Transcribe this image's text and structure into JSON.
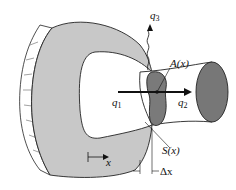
{
  "diagram": {
    "colors": {
      "body_fill": "#c8c8c8",
      "section_fill": "#7a7a7a",
      "end_fill": "#777777",
      "outline": "#222222",
      "background": "#ffffff"
    },
    "labels": {
      "q1": {
        "main": "q",
        "sub": "1"
      },
      "q2": {
        "main": "q",
        "sub": "2"
      },
      "q3": {
        "main": "q",
        "sub": "3"
      },
      "area": "A(x)",
      "surface": "S(x)",
      "axis": "x",
      "delta": "Δx"
    }
  }
}
